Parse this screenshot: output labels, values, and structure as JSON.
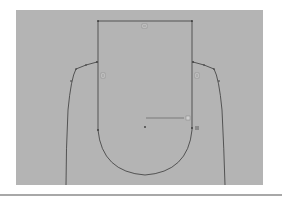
{
  "canvas": {
    "background": "#b4b4b4",
    "line_color": "#3a3a3a",
    "relation_icons": [
      {
        "name": "horizontal-relation-icon",
        "label": "═"
      },
      {
        "name": "vertical-relation-icon-left",
        "label": "|"
      },
      {
        "name": "vertical-relation-icon-right",
        "label": "|"
      },
      {
        "name": "coincident-relation-icon",
        "label": "⊥"
      },
      {
        "name": "tangent-relation-icon",
        "label": "∂"
      }
    ]
  }
}
